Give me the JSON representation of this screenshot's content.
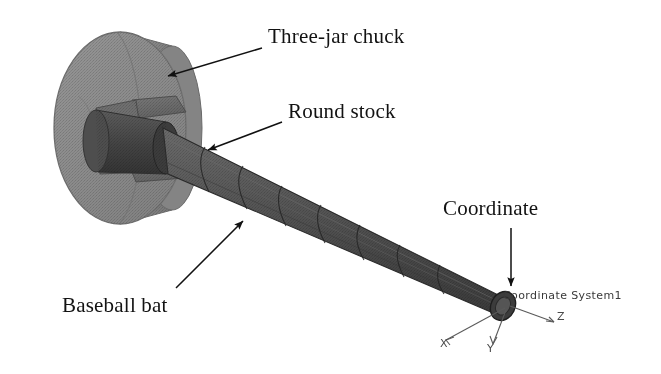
{
  "figure": {
    "type": "cad-assembly-diagram",
    "background_color": "#ffffff",
    "ink_color": "#121212"
  },
  "callouts": [
    {
      "id": "three-jar-chuck",
      "label": "Three-jar chuck",
      "label_x": 268,
      "label_y": 26,
      "arrow_from": [
        262,
        48
      ],
      "arrow_to": [
        159,
        78
      ],
      "arrow_head_angle_deg": 196
    },
    {
      "id": "round-stock",
      "label": "Round stock",
      "label_x": 288,
      "label_y": 101,
      "arrow_from": [
        282,
        122
      ],
      "arrow_to": [
        199,
        152
      ],
      "arrow_head_angle_deg": 200
    },
    {
      "id": "baseball-bat",
      "label": "Baseball bat",
      "label_x": 62,
      "label_y": 295,
      "arrow_from": [
        176,
        288
      ],
      "arrow_to": [
        249,
        215
      ],
      "arrow_head_angle_deg": 315
    },
    {
      "id": "coordinate",
      "label": "Coordinate",
      "label_x": 443,
      "label_y": 198,
      "arrow_from": [
        511,
        228
      ],
      "arrow_to": [
        511,
        292
      ],
      "arrow_head_angle_deg": 90
    }
  ],
  "coordinate_system": {
    "name": "Coordinate System1",
    "origin": [
      503,
      306
    ],
    "axes": [
      {
        "name": "X",
        "letter": "X",
        "tip": [
          443,
          342
        ],
        "letter_x": 440,
        "letter_y": 337
      },
      {
        "name": "Y",
        "letter": "Y",
        "tip": [
          492,
          347
        ],
        "letter_x": 487,
        "letter_y": 342
      },
      {
        "name": "Z",
        "letter": "Z",
        "tip": [
          556,
          322
        ],
        "letter_x": 557,
        "letter_y": 310
      }
    ]
  },
  "parts": {
    "chuck": {
      "name": "Three-jar chuck",
      "shape": "cylinder-disc",
      "fill": "#8e8e8e",
      "edge": "#6e6e6e",
      "center": [
        120,
        128
      ],
      "face_rx": 66,
      "face_ry": 96,
      "depth": 58
    },
    "jaws": {
      "name": "chuck jaws",
      "count": 3,
      "fill": "#6d6d6d",
      "edge": "#4f4f4f"
    },
    "round_stock": {
      "name": "Round stock",
      "fill": "#4a4a4a",
      "edge": "#303030",
      "hub_center": [
        166,
        148
      ],
      "hub_rx": 17,
      "hub_ry": 26
    },
    "bat": {
      "name": "Baseball bat",
      "fill": "#555555",
      "edge": "#2e2e2e",
      "barrel_end": [
        170,
        150
      ],
      "tip_end": [
        505,
        306
      ],
      "barrel_radius": 24,
      "tip_radius": 13,
      "segment_rings": 7
    }
  }
}
